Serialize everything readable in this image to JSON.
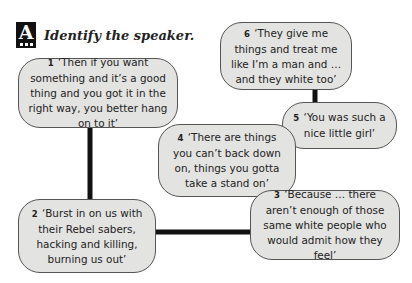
{
  "header": {
    "badge_letter": "A",
    "title": "Identify the speaker."
  },
  "quotes": [
    {
      "number": "1",
      "text": "‘Then if you want something and it’s a good thing and you got it in the right way, you better hang on to it’"
    },
    {
      "number": "2",
      "text": "‘Burst in on us with their Rebel sabers, hacking and killing, burning us out’"
    },
    {
      "number": "3",
      "text": "‘Because … there aren’t enough of those same white people who would admit how they feel’"
    },
    {
      "number": "4",
      "text": "‘There are things you can’t back down on, things you gotta take a stand on’"
    },
    {
      "number": "5",
      "text": "‘You was such a nice little girl’"
    },
    {
      "number": "6",
      "text": "‘They give me things and treat me like I’m a man and … and they white too’"
    }
  ],
  "colors": {
    "box_fill": "#e3e3e1",
    "box_border": "#555555",
    "connector": "#111111"
  }
}
